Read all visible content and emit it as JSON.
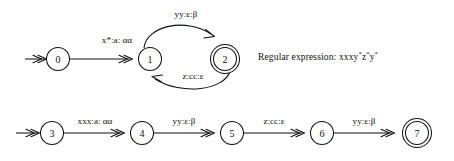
{
  "figure": {
    "background_color": "#ffffff",
    "ink_color": "#111111"
  },
  "automaton_top": {
    "name": "top-automaton",
    "states": [
      {
        "id": "0",
        "label": "0",
        "cx": 58,
        "cy": 59,
        "r": 11.5,
        "accepting": false,
        "start": true
      },
      {
        "id": "1",
        "label": "1",
        "cx": 150,
        "cy": 59,
        "r": 11.5,
        "accepting": false,
        "start": false
      },
      {
        "id": "2",
        "label": "2",
        "cx": 225,
        "cy": 59,
        "r": 11.5,
        "accepting": true,
        "start": false
      }
    ],
    "transitions": [
      {
        "from": "0",
        "to": "1",
        "label": "x*:a: αα",
        "shape": "straight"
      },
      {
        "from": "1",
        "to": "2",
        "label": "yy:ε:β",
        "shape": "arc-above"
      },
      {
        "from": "2",
        "to": "1",
        "label": "z:cc:ε",
        "shape": "arc-below"
      }
    ]
  },
  "automaton_bottom": {
    "name": "bottom-automaton",
    "states": [
      {
        "id": "3",
        "label": "3",
        "cx": 52,
        "cy": 133,
        "r": 11.5,
        "accepting": false,
        "start": true
      },
      {
        "id": "4",
        "label": "4",
        "cx": 142,
        "cy": 133,
        "r": 11.5,
        "accepting": false,
        "start": false
      },
      {
        "id": "5",
        "label": "5",
        "cx": 232,
        "cy": 133,
        "r": 11.5,
        "accepting": false,
        "start": false
      },
      {
        "id": "6",
        "label": "6",
        "cx": 322,
        "cy": 133,
        "r": 11.5,
        "accepting": false,
        "start": false
      },
      {
        "id": "7",
        "label": "7",
        "cx": 417,
        "cy": 133,
        "r": 11.5,
        "accepting": true,
        "start": false
      }
    ],
    "transitions": [
      {
        "from": "3",
        "to": "4",
        "label": "xxx:a: αα",
        "shape": "straight"
      },
      {
        "from": "4",
        "to": "5",
        "label": "yy:ε:β",
        "shape": "straight"
      },
      {
        "from": "5",
        "to": "6",
        "label": "z:cc:ε",
        "shape": "straight"
      },
      {
        "from": "6",
        "to": "7",
        "label": "yy:ε:β",
        "shape": "straight"
      }
    ]
  },
  "annotation": {
    "regex_prefix": "Regular expression: ",
    "regex_body": "xxxy*z*y*",
    "regex_full": "Regular expression: xxxy*z*y*",
    "regex_parts": [
      {
        "text": "xxxy",
        "sup": false
      },
      {
        "text": "*",
        "sup": true
      },
      {
        "text": "z",
        "sup": false
      },
      {
        "text": "*",
        "sup": true
      },
      {
        "text": "y",
        "sup": false
      },
      {
        "text": "*",
        "sup": true
      }
    ]
  },
  "labels": {
    "top_edge_0_1": "x*:a: αα",
    "top_edge_1_2": "yy:ε:β",
    "top_edge_2_1": "z:cc:ε",
    "bot_edge_3_4": "xxx:a: αα",
    "bot_edge_4_5": "yy:ε:β",
    "bot_edge_5_6": "z:cc:ε",
    "bot_edge_6_7": "yy:ε:β"
  }
}
